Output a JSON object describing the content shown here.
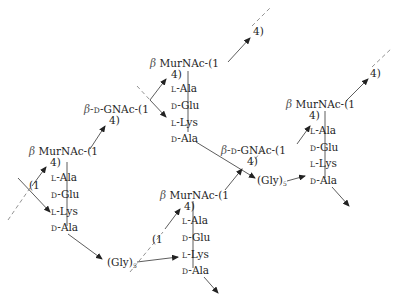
{
  "diagram": {
    "type": "peptidoglycan structure",
    "colors": {
      "line": "#333333",
      "dash": "#777777",
      "text": "#1e1e1e"
    },
    "unit1": {
      "murnac": {
        "beta": "β",
        "name": "MurNAc-(1"
      },
      "link4": "4)",
      "left_link": "(1",
      "peptide": [
        {
          "config": "L",
          "residue": "-Ala"
        },
        {
          "config": "D",
          "residue": "-Glu"
        },
        {
          "config": "L",
          "residue": "-Lys"
        },
        {
          "config": "D",
          "residue": "-Ala"
        }
      ]
    },
    "gnac1": {
      "prefix": "β-",
      "config": "D",
      "name": "-GNAc-(1",
      "link4": "4)"
    },
    "unit2": {
      "murnac": {
        "beta": "β",
        "name": "MurNAc-(1"
      },
      "link4": "4)",
      "top_link4": "4)",
      "peptide": [
        {
          "config": "L",
          "residue": "-Ala"
        },
        {
          "config": "D",
          "residue": "-Glu"
        },
        {
          "config": "L",
          "residue": "-Lys"
        },
        {
          "config": "D",
          "residue": "-Ala"
        }
      ]
    },
    "gly1": {
      "label": "(Gly)",
      "sub": "5"
    },
    "gly2": {
      "label": "(Gly)",
      "sub": "5"
    },
    "unit3": {
      "murnac": {
        "beta": "β",
        "name": "MurNAc-(1"
      },
      "link4": "4)",
      "left_link": "(1",
      "peptide": [
        {
          "config": "L",
          "residue": "-Ala"
        },
        {
          "config": "D",
          "residue": "-Glu"
        },
        {
          "config": "L",
          "residue": "-Lys"
        },
        {
          "config": "D",
          "residue": "-Ala"
        }
      ]
    },
    "gnac2": {
      "prefix": "β-",
      "config": "D",
      "name": "-GNAc-(1",
      "link4": "4)"
    },
    "unit4": {
      "murnac": {
        "beta": "β",
        "name": "MurNAc-(1"
      },
      "link4": "4)",
      "top_link4": "4)",
      "peptide": [
        {
          "config": "L",
          "residue": "-Ala"
        },
        {
          "config": "D",
          "residue": "-Glu"
        },
        {
          "config": "L",
          "residue": "-Lys"
        },
        {
          "config": "D",
          "residue": "-Ala"
        }
      ]
    }
  }
}
